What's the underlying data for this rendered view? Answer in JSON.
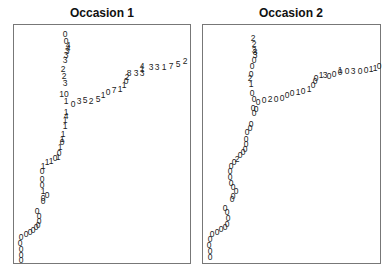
{
  "chart_data": [
    {
      "type": "scatter",
      "title": "Occasion 1",
      "xlabel": "",
      "ylabel": "",
      "grid": false,
      "legend": null,
      "note": "Text-labelled scatter; each point is drawn as a digit label. Coordinates in panel pixel space (x from left, y from top).",
      "points": [
        {
          "x": 51,
          "y": 9,
          "label": "0"
        },
        {
          "x": 52,
          "y": 16,
          "label": "0"
        },
        {
          "x": 54,
          "y": 20,
          "label": "4"
        },
        {
          "x": 54,
          "y": 23,
          "label": "4"
        },
        {
          "x": 53,
          "y": 26,
          "label": "3"
        },
        {
          "x": 52,
          "y": 30,
          "label": "3"
        },
        {
          "x": 51,
          "y": 35,
          "label": "3"
        },
        {
          "x": 49,
          "y": 44,
          "label": "2"
        },
        {
          "x": 50,
          "y": 51,
          "label": "2"
        },
        {
          "x": 51,
          "y": 58,
          "label": "3"
        },
        {
          "x": 50,
          "y": 69,
          "label": "10"
        },
        {
          "x": 52,
          "y": 76,
          "label": "1"
        },
        {
          "x": 59,
          "y": 79,
          "label": "0"
        },
        {
          "x": 65,
          "y": 76,
          "label": "3"
        },
        {
          "x": 71,
          "y": 75,
          "label": "5"
        },
        {
          "x": 77,
          "y": 76,
          "label": "2"
        },
        {
          "x": 84,
          "y": 74,
          "label": "5"
        },
        {
          "x": 89,
          "y": 70,
          "label": "1"
        },
        {
          "x": 94,
          "y": 67,
          "label": "0"
        },
        {
          "x": 100,
          "y": 65,
          "label": "7"
        },
        {
          "x": 106,
          "y": 64,
          "label": "1"
        },
        {
          "x": 110,
          "y": 60,
          "label": "1"
        },
        {
          "x": 112,
          "y": 56,
          "label": "0"
        },
        {
          "x": 113,
          "y": 52,
          "label": "2"
        },
        {
          "x": 115,
          "y": 48,
          "label": "8"
        },
        {
          "x": 122,
          "y": 48,
          "label": "3"
        },
        {
          "x": 128,
          "y": 48,
          "label": "3"
        },
        {
          "x": 128,
          "y": 44,
          "label": "1"
        },
        {
          "x": 128,
          "y": 41,
          "label": "4"
        },
        {
          "x": 137,
          "y": 42,
          "label": "3"
        },
        {
          "x": 143,
          "y": 42,
          "label": "3"
        },
        {
          "x": 150,
          "y": 42,
          "label": "1"
        },
        {
          "x": 157,
          "y": 41,
          "label": "7"
        },
        {
          "x": 164,
          "y": 39,
          "label": "5"
        },
        {
          "x": 171,
          "y": 36,
          "label": "2"
        },
        {
          "x": 52,
          "y": 87,
          "label": "1"
        },
        {
          "x": 52,
          "y": 91,
          "label": "4"
        },
        {
          "x": 51,
          "y": 95,
          "label": "1"
        },
        {
          "x": 51,
          "y": 101,
          "label": "1"
        },
        {
          "x": 49,
          "y": 109,
          "label": "1"
        },
        {
          "x": 48,
          "y": 114,
          "label": "1"
        },
        {
          "x": 48,
          "y": 117,
          "label": "0"
        },
        {
          "x": 46,
          "y": 122,
          "label": "1"
        },
        {
          "x": 45,
          "y": 128,
          "label": "0"
        },
        {
          "x": 44,
          "y": 132,
          "label": "1"
        },
        {
          "x": 41,
          "y": 133,
          "label": "0"
        },
        {
          "x": 37,
          "y": 136,
          "label": "1"
        },
        {
          "x": 33,
          "y": 137,
          "label": "1"
        },
        {
          "x": 29,
          "y": 141,
          "label": "1"
        },
        {
          "x": 28,
          "y": 146,
          "label": "0"
        },
        {
          "x": 28,
          "y": 154,
          "label": "0"
        },
        {
          "x": 28,
          "y": 160,
          "label": "0"
        },
        {
          "x": 29,
          "y": 166,
          "label": "1"
        },
        {
          "x": 33,
          "y": 170,
          "label": "0"
        },
        {
          "x": 29,
          "y": 173,
          "label": "0"
        },
        {
          "x": 29,
          "y": 176,
          "label": "0"
        },
        {
          "x": 23,
          "y": 186,
          "label": "0"
        },
        {
          "x": 25,
          "y": 191,
          "label": "0"
        },
        {
          "x": 25,
          "y": 196,
          "label": "0"
        },
        {
          "x": 24,
          "y": 200,
          "label": "0"
        },
        {
          "x": 22,
          "y": 202,
          "label": "0"
        },
        {
          "x": 19,
          "y": 205,
          "label": "0"
        },
        {
          "x": 16,
          "y": 207,
          "label": "0"
        },
        {
          "x": 12,
          "y": 209,
          "label": "0"
        },
        {
          "x": 7,
          "y": 212,
          "label": "0"
        },
        {
          "x": 6,
          "y": 218,
          "label": "0"
        },
        {
          "x": 7,
          "y": 224,
          "label": "0"
        },
        {
          "x": 7,
          "y": 230,
          "label": "0"
        },
        {
          "x": 7,
          "y": 235,
          "label": "0"
        }
      ]
    },
    {
      "type": "scatter",
      "title": "Occasion 2",
      "xlabel": "",
      "ylabel": "",
      "grid": false,
      "legend": null,
      "note": "Text-labelled scatter; each point is drawn as a digit label. Coordinates in panel pixel space (x from left, y from top).",
      "points": [
        {
          "x": 50,
          "y": 13,
          "label": "2"
        },
        {
          "x": 51,
          "y": 19,
          "label": "2"
        },
        {
          "x": 51,
          "y": 25,
          "label": "3"
        },
        {
          "x": 52,
          "y": 27,
          "label": "8"
        },
        {
          "x": 52,
          "y": 30,
          "label": "3"
        },
        {
          "x": 51,
          "y": 35,
          "label": "0"
        },
        {
          "x": 49,
          "y": 41,
          "label": "0"
        },
        {
          "x": 48,
          "y": 49,
          "label": "0"
        },
        {
          "x": 47,
          "y": 53,
          "label": "2"
        },
        {
          "x": 48,
          "y": 59,
          "label": "1"
        },
        {
          "x": 49,
          "y": 68,
          "label": "0"
        },
        {
          "x": 51,
          "y": 74,
          "label": "0"
        },
        {
          "x": 55,
          "y": 77,
          "label": "0"
        },
        {
          "x": 61,
          "y": 75,
          "label": "0"
        },
        {
          "x": 67,
          "y": 74,
          "label": "2"
        },
        {
          "x": 73,
          "y": 74,
          "label": "0"
        },
        {
          "x": 79,
          "y": 73,
          "label": "0"
        },
        {
          "x": 84,
          "y": 70,
          "label": "0"
        },
        {
          "x": 89,
          "y": 68,
          "label": "0"
        },
        {
          "x": 95,
          "y": 67,
          "label": "1"
        },
        {
          "x": 100,
          "y": 66,
          "label": "0"
        },
        {
          "x": 106,
          "y": 64,
          "label": "1"
        },
        {
          "x": 110,
          "y": 60,
          "label": "0"
        },
        {
          "x": 112,
          "y": 56,
          "label": "0"
        },
        {
          "x": 113,
          "y": 53,
          "label": "0"
        },
        {
          "x": 118,
          "y": 50,
          "label": "1"
        },
        {
          "x": 122,
          "y": 50,
          "label": "3"
        },
        {
          "x": 126,
          "y": 51,
          "label": "0"
        },
        {
          "x": 131,
          "y": 49,
          "label": "0"
        },
        {
          "x": 137,
          "y": 45,
          "label": "1"
        },
        {
          "x": 137,
          "y": 47,
          "label": "0"
        },
        {
          "x": 144,
          "y": 46,
          "label": "0"
        },
        {
          "x": 150,
          "y": 46,
          "label": "3"
        },
        {
          "x": 157,
          "y": 46,
          "label": "0"
        },
        {
          "x": 163,
          "y": 45,
          "label": "0"
        },
        {
          "x": 168,
          "y": 44,
          "label": "1"
        },
        {
          "x": 172,
          "y": 43,
          "label": "1"
        },
        {
          "x": 176,
          "y": 41,
          "label": "0"
        },
        {
          "x": 50,
          "y": 83,
          "label": "0"
        },
        {
          "x": 53,
          "y": 84,
          "label": "0"
        },
        {
          "x": 51,
          "y": 88,
          "label": "0"
        },
        {
          "x": 48,
          "y": 99,
          "label": "0"
        },
        {
          "x": 47,
          "y": 103,
          "label": "0"
        },
        {
          "x": 44,
          "y": 107,
          "label": "0"
        },
        {
          "x": 43,
          "y": 114,
          "label": "0"
        },
        {
          "x": 43,
          "y": 119,
          "label": "0"
        },
        {
          "x": 42,
          "y": 124,
          "label": "0"
        },
        {
          "x": 40,
          "y": 127,
          "label": "0"
        },
        {
          "x": 37,
          "y": 130,
          "label": "0"
        },
        {
          "x": 34,
          "y": 134,
          "label": "2"
        },
        {
          "x": 31,
          "y": 137,
          "label": "0"
        },
        {
          "x": 28,
          "y": 141,
          "label": "0"
        },
        {
          "x": 27,
          "y": 146,
          "label": "0"
        },
        {
          "x": 27,
          "y": 152,
          "label": "0"
        },
        {
          "x": 28,
          "y": 158,
          "label": "0"
        },
        {
          "x": 30,
          "y": 162,
          "label": "0"
        },
        {
          "x": 33,
          "y": 166,
          "label": "0"
        },
        {
          "x": 30,
          "y": 171,
          "label": "0"
        },
        {
          "x": 29,
          "y": 174,
          "label": "0"
        },
        {
          "x": 22,
          "y": 183,
          "label": "0"
        },
        {
          "x": 24,
          "y": 187,
          "label": "0"
        },
        {
          "x": 25,
          "y": 193,
          "label": "0"
        },
        {
          "x": 24,
          "y": 199,
          "label": "0"
        },
        {
          "x": 22,
          "y": 202,
          "label": "0"
        },
        {
          "x": 18,
          "y": 204,
          "label": "0"
        },
        {
          "x": 14,
          "y": 207,
          "label": "0"
        },
        {
          "x": 9,
          "y": 209,
          "label": "0"
        },
        {
          "x": 7,
          "y": 214,
          "label": "0"
        },
        {
          "x": 6,
          "y": 220,
          "label": "0"
        },
        {
          "x": 7,
          "y": 226,
          "label": "0"
        },
        {
          "x": 7,
          "y": 232,
          "label": "0"
        }
      ]
    }
  ],
  "panels": [
    {
      "title": "Occasion 1"
    },
    {
      "title": "Occasion 2"
    }
  ]
}
